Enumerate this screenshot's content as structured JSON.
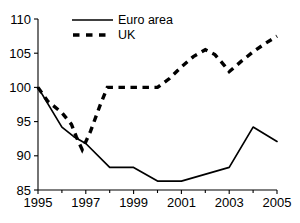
{
  "chart_data": {
    "type": "line",
    "title": "",
    "subtitle": "",
    "xlabel": "",
    "ylabel": "",
    "xlim": [
      1995,
      2005
    ],
    "ylim": [
      85,
      110
    ],
    "grid": false,
    "legend_position": "top-center",
    "x_tick_labels": [
      "1995",
      "1997",
      "1999",
      "2001",
      "2003",
      "2005"
    ],
    "x_tick_values": [
      1995,
      1997,
      1999,
      2001,
      2003,
      2005
    ],
    "x_minor_tick_values": [
      1996,
      1998,
      2000,
      2002,
      2004
    ],
    "y_tick_labels": [
      "85",
      "90",
      "95",
      "100",
      "105",
      "110"
    ],
    "y_tick_values": [
      85,
      90,
      95,
      100,
      105,
      110
    ],
    "x": [
      1995,
      1996,
      1997,
      1998,
      1999,
      2000,
      2001,
      2002,
      2003,
      2004,
      2005
    ],
    "series": [
      {
        "name": "Euro area",
        "style": "solid",
        "values": [
          100.0,
          94.2,
          91.8,
          88.3,
          88.3,
          86.3,
          86.3,
          87.0,
          88.3,
          94.2,
          92.1
        ]
      },
      {
        "name": "UK",
        "style": "dashed",
        "values": [
          100.0,
          96.3,
          91.0,
          100.0,
          100.0,
          100.0,
          102.0,
          105.5,
          103.0,
          105.2,
          107.5
        ]
      }
    ],
    "series_detail": [
      {
        "name": "Euro area",
        "points": [
          {
            "x": 1995.0,
            "y": 100.0
          },
          {
            "x": 1996.0,
            "y": 94.2
          },
          {
            "x": 1996.5,
            "y": 92.8
          },
          {
            "x": 1997.0,
            "y": 91.8
          },
          {
            "x": 1998.0,
            "y": 88.3
          },
          {
            "x": 1999.0,
            "y": 88.3
          },
          {
            "x": 2000.0,
            "y": 86.3
          },
          {
            "x": 2001.0,
            "y": 86.3
          },
          {
            "x": 2003.0,
            "y": 88.3
          },
          {
            "x": 2004.0,
            "y": 94.2
          },
          {
            "x": 2005.0,
            "y": 92.1
          }
        ]
      },
      {
        "name": "UK",
        "points": [
          {
            "x": 1995.0,
            "y": 100.0
          },
          {
            "x": 1995.4,
            "y": 98.0
          },
          {
            "x": 1996.0,
            "y": 96.3
          },
          {
            "x": 1996.4,
            "y": 94.6
          },
          {
            "x": 1996.6,
            "y": 92.8
          },
          {
            "x": 1996.85,
            "y": 90.9
          },
          {
            "x": 1997.2,
            "y": 93.6
          },
          {
            "x": 1997.6,
            "y": 97.4
          },
          {
            "x": 1997.9,
            "y": 100.0
          },
          {
            "x": 2000.0,
            "y": 100.0
          },
          {
            "x": 2000.5,
            "y": 101.3
          },
          {
            "x": 2001.0,
            "y": 103.0
          },
          {
            "x": 2001.5,
            "y": 104.5
          },
          {
            "x": 2002.0,
            "y": 105.5
          },
          {
            "x": 2002.4,
            "y": 104.8
          },
          {
            "x": 2002.8,
            "y": 103.2
          },
          {
            "x": 2003.0,
            "y": 102.3
          },
          {
            "x": 2003.5,
            "y": 103.8
          },
          {
            "x": 2004.0,
            "y": 105.2
          },
          {
            "x": 2004.5,
            "y": 106.4
          },
          {
            "x": 2005.0,
            "y": 107.5
          }
        ]
      }
    ],
    "legend": [
      {
        "label": "Euro area",
        "style": "solid"
      },
      {
        "label": "UK",
        "style": "dashed"
      }
    ]
  }
}
